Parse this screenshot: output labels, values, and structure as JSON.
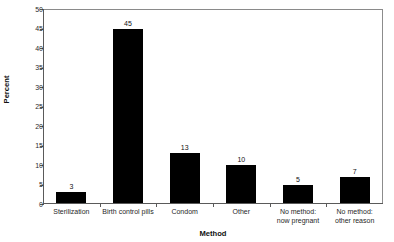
{
  "chart_data": {
    "type": "bar",
    "title": "Figure 1. Contraceptive Use Among U.S. Women, 1995",
    "xlabel": "Method",
    "ylabel": "Percent",
    "categories": [
      "Sterilization",
      "Birth control pills",
      "Condom",
      "Other",
      "No method:\nnow pregnant",
      "No method:\nother reason"
    ],
    "category_lines": [
      [
        "Sterilization"
      ],
      [
        "Birth control pills"
      ],
      [
        "Condom"
      ],
      [
        "Other"
      ],
      [
        "No method:",
        "now pregnant"
      ],
      [
        "No method:",
        "other reason"
      ]
    ],
    "values": [
      3,
      45,
      13,
      10,
      5,
      7
    ],
    "data_labels": [
      "3",
      "45",
      "13",
      "10",
      "5",
      "7"
    ],
    "ylim": [
      0,
      50
    ],
    "yticks": [
      0,
      5,
      10,
      15,
      20,
      25,
      30,
      35,
      40,
      45,
      50
    ],
    "ytick_labels": [
      "0",
      "5",
      "10",
      "15",
      "20",
      "25",
      "30",
      "35",
      "40",
      "45",
      "50"
    ],
    "grid": false,
    "legend": null,
    "bar_color": "#000000",
    "frame_color": "#8c8c8c",
    "axis_color": "#5a5a5a"
  }
}
